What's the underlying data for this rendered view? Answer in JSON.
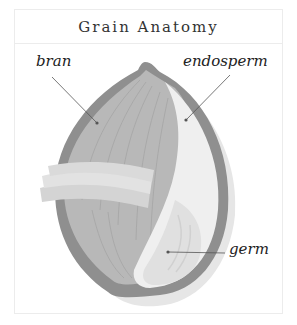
{
  "title": "Grain Anatomy",
  "labels": {
    "bran": "bran",
    "endosperm": "endosperm",
    "germ": "germ"
  },
  "colors": {
    "bran_outer": "#8f8f8f",
    "bran_layer": "#b5b5b5",
    "endosperm": "#efefef",
    "germ": "#dcdcdc",
    "shadow": "#e6e6e6",
    "leader": "#555555"
  }
}
